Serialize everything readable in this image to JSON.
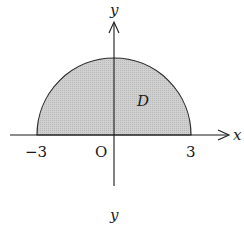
{
  "figure": {
    "axis_labels": {
      "x": "x",
      "y": "y"
    },
    "origin_label": "O",
    "tick_labels": {
      "left": "−3",
      "right": "3"
    },
    "region_label": "D",
    "caption": "y",
    "colors": {
      "fill": "#c8c8c8",
      "stroke": "#1a1a1a",
      "background": "#ffffff"
    },
    "shape": "upper semicircle of radius 3 centered at origin"
  }
}
